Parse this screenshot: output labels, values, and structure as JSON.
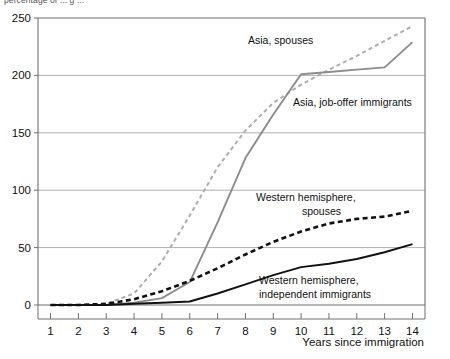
{
  "figure": {
    "clipped_header": "percentage of ... g ...",
    "xlabel": "Years since immigration"
  },
  "annotations": {
    "asia_spouses": "Asia, spouses",
    "asia_joboffer": "Asia, job-offer immigrants",
    "west_spouses_line1": "Western hemisphere,",
    "west_spouses_line2": "spouses",
    "west_independent_line1": "Western hemisphere,",
    "west_independent_line2": "independent immigrants"
  },
  "colors": {
    "asia_spouses": "#adadad",
    "asia_joboffer": "#8c8c8c",
    "west_spouses": "#111111",
    "west_independent": "#111111",
    "grid": "#9a9a9a",
    "axis": "#6f6f6f"
  },
  "chart_data": {
    "type": "line",
    "title": "",
    "xlabel": "Years since immigration",
    "ylabel": "",
    "x": [
      1,
      2,
      3,
      4,
      5,
      6,
      7,
      8,
      9,
      10,
      11,
      12,
      13,
      14
    ],
    "xlim": [
      0.55,
      14.45
    ],
    "ylim": [
      0,
      250
    ],
    "yticks": [
      0,
      50,
      100,
      150,
      200,
      250
    ],
    "xticks": [
      1,
      2,
      3,
      4,
      5,
      6,
      7,
      8,
      9,
      10,
      11,
      12,
      13,
      14
    ],
    "grid": true,
    "legend": "inline-annotations",
    "series": [
      {
        "name": "Asia, spouses",
        "style": "dashed",
        "color": "#adadad",
        "values": [
          0,
          0,
          1,
          10,
          38,
          78,
          120,
          152,
          176,
          192,
          205,
          217,
          230,
          243
        ]
      },
      {
        "name": "Asia, job-offer immigrants",
        "style": "solid",
        "color": "#8c8c8c",
        "values": [
          0,
          0,
          0,
          2,
          6,
          20,
          72,
          128,
          166,
          201,
          203,
          205,
          207,
          229
        ]
      },
      {
        "name": "Western hemisphere, spouses",
        "style": "dashed",
        "color": "#111111",
        "values": [
          0,
          0,
          1,
          5,
          12,
          21,
          32,
          44,
          55,
          64,
          71,
          75,
          77,
          82
        ]
      },
      {
        "name": "Western hemisphere, independent immigrants",
        "style": "solid",
        "color": "#111111",
        "values": [
          0,
          0,
          0,
          1,
          2,
          3,
          10,
          18,
          26,
          33,
          36,
          40,
          46,
          53
        ]
      }
    ]
  }
}
